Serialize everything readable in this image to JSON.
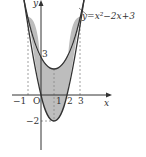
{
  "diagram": {
    "curve_label": "y=x²−2x+3",
    "axes": {
      "x_label": "x",
      "y_label": "y",
      "origin_label": "O"
    },
    "x_ticks": [
      {
        "value": -1,
        "label": "−1"
      },
      {
        "value": 1,
        "label": "1"
      },
      {
        "value": 2,
        "label": "2"
      },
      {
        "value": 3,
        "label": "3"
      }
    ],
    "y_ticks": [
      {
        "value": 3,
        "label": "3"
      },
      {
        "value": -2,
        "label": "−2"
      }
    ],
    "curves": [
      {
        "name": "outer-parabola",
        "equation": "y=x^2-2x+3"
      },
      {
        "name": "inner-parabola",
        "equation": "y=2x^2-4x"
      }
    ],
    "shaded_region": {
      "from_x": -1,
      "to_x": 3
    },
    "colors": {
      "stroke": "#333333",
      "shade": "#bdbdbd",
      "dashed": "#888888"
    }
  }
}
